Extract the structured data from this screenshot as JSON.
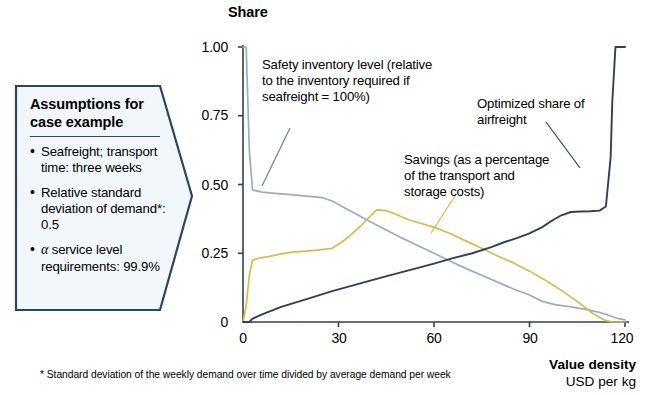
{
  "callout": {
    "title_line1": "Assumptions for",
    "title_line2": "case example",
    "bullets": [
      "Seafreight; transport time: three weeks",
      "Relative standard deviation of demand*: 0.5",
      " service level requirements: 99.9%"
    ],
    "bullet3_prefix_symbol": "α",
    "border_color": "#2c4660",
    "fill_color": "#f2f7fb"
  },
  "footnote": "* Standard deviation of the weekly demand over time divided by average demand per week",
  "chart_data": {
    "type": "line",
    "title": "",
    "ylabel": "Share",
    "xlabel_bold": "Value density",
    "xlabel_sub": "USD per kg",
    "xlim": [
      0,
      120
    ],
    "ylim": [
      0,
      1.0
    ],
    "xticks": [
      0,
      30,
      60,
      90,
      120
    ],
    "xtick_labels": [
      "0",
      "30",
      "60",
      "90",
      "120"
    ],
    "yticks": [
      0,
      0.25,
      0.5,
      0.75,
      1.0
    ],
    "ytick_labels": [
      "0",
      "0.25",
      "0.50",
      "0.75",
      "1.00"
    ],
    "grid": false,
    "legend_position": "annotations-inline",
    "series": [
      {
        "name": "Safety inventory level",
        "color": "#9bacbd",
        "annotation": "Safety inventory level (relative to the inventory required if seafreight = 100%)",
        "x": [
          0,
          1,
          2,
          3,
          6,
          10,
          15,
          20,
          25,
          28,
          32,
          36,
          40,
          45,
          50,
          55,
          60,
          65,
          70,
          75,
          80,
          85,
          90,
          94,
          98,
          103,
          108,
          112,
          116,
          118,
          120
        ],
        "y": [
          1.0,
          1.0,
          0.62,
          0.48,
          0.472,
          0.468,
          0.463,
          0.458,
          0.452,
          0.44,
          0.415,
          0.39,
          0.365,
          0.335,
          0.305,
          0.277,
          0.25,
          0.222,
          0.195,
          0.17,
          0.145,
          0.12,
          0.098,
          0.075,
          0.063,
          0.055,
          0.045,
          0.035,
          0.02,
          0.012,
          0.008
        ]
      },
      {
        "name": "Savings",
        "color": "#d9b94c",
        "annotation": "Savings (as a percentage of the transport and storage costs)",
        "x": [
          0,
          1,
          2,
          3,
          5,
          8,
          12,
          16,
          20,
          24,
          28,
          31,
          34,
          37,
          40,
          42,
          45,
          48,
          52,
          56,
          60,
          65,
          70,
          75,
          80,
          85,
          90,
          95,
          100,
          105,
          110,
          114,
          116,
          120
        ],
        "y": [
          0.0,
          0.06,
          0.17,
          0.225,
          0.232,
          0.238,
          0.248,
          0.255,
          0.258,
          0.262,
          0.268,
          0.29,
          0.318,
          0.35,
          0.385,
          0.408,
          0.405,
          0.392,
          0.372,
          0.358,
          0.345,
          0.322,
          0.295,
          0.268,
          0.24,
          0.215,
          0.185,
          0.152,
          0.115,
          0.075,
          0.03,
          0.005,
          0.0,
          0.0
        ]
      },
      {
        "name": "Optimized share of airfreight",
        "color": "#2e4156",
        "annotation": "Optimized share of airfreight",
        "x": [
          0,
          2,
          3,
          6,
          12,
          20,
          28,
          36,
          44,
          52,
          60,
          66,
          72,
          78,
          82,
          86,
          90,
          94,
          97,
          100,
          103,
          106,
          109,
          112,
          114,
          115.5,
          116,
          117,
          120
        ],
        "y": [
          0.0,
          0.0,
          0.012,
          0.028,
          0.055,
          0.083,
          0.112,
          0.138,
          0.163,
          0.188,
          0.212,
          0.232,
          0.25,
          0.272,
          0.29,
          0.305,
          0.322,
          0.345,
          0.368,
          0.388,
          0.4,
          0.402,
          0.403,
          0.405,
          0.42,
          0.6,
          0.8,
          1.0,
          1.0
        ]
      }
    ]
  }
}
